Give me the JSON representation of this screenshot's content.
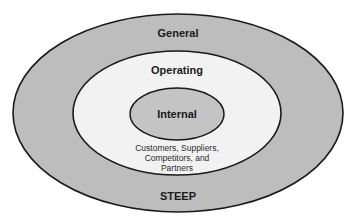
{
  "diagram": {
    "type": "nested-ellipses",
    "colors": {
      "outer_fill": "#bdbdbd",
      "middle_fill": "#f2f2f2",
      "inner_fill": "#c4c4c4",
      "stroke": "#1a1a1a",
      "background": "#ffffff"
    },
    "layers": [
      {
        "name": "General",
        "position": "outer",
        "footer": "STEEP"
      },
      {
        "name": "Operating",
        "position": "middle",
        "footer_lines": [
          "Customers, Suppliers,",
          "Competitors, and",
          "Partners"
        ]
      },
      {
        "name": "Internal",
        "position": "inner"
      }
    ]
  },
  "labels": {
    "general": "General",
    "steep": "STEEP",
    "operating": "Operating",
    "internal": "Internal",
    "operating_desc_1": "Customers, Suppliers,",
    "operating_desc_2": "Competitors, and",
    "operating_desc_3": "Partners"
  }
}
